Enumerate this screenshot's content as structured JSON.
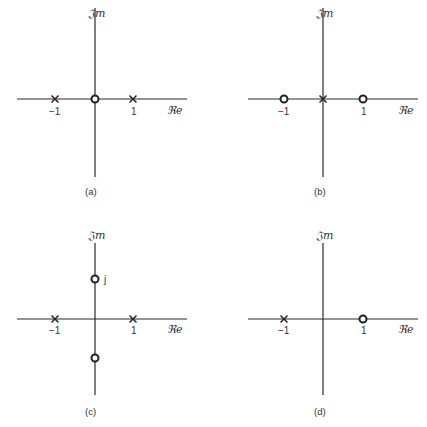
{
  "figure": {
    "panels": [
      {
        "id": "a",
        "caption": "(a)",
        "im_label": "𝔍m",
        "re_label": "ℜe",
        "poles": [
          -1,
          1
        ],
        "zeros": [
          0
        ],
        "tick_labels": [
          "−1",
          "1"
        ]
      },
      {
        "id": "b",
        "caption": "(b)",
        "im_label": "𝔍m",
        "re_label": "ℜe",
        "poles": [
          0
        ],
        "zeros": [
          -1,
          1
        ],
        "tick_labels": [
          "−1",
          "1"
        ]
      },
      {
        "id": "c",
        "caption": "(c)",
        "im_label": "𝔍m",
        "re_label": "ℜe",
        "poles": [
          -1,
          1
        ],
        "zeros": [
          "j",
          "-j"
        ],
        "tick_labels": [
          "−1",
          "1"
        ],
        "imag_label": "j"
      },
      {
        "id": "d",
        "caption": "(d)",
        "im_label": "𝔍m",
        "re_label": "ℜe",
        "poles": [
          -1
        ],
        "zeros": [
          1
        ],
        "tick_labels": [
          "−1",
          "1"
        ]
      }
    ]
  }
}
